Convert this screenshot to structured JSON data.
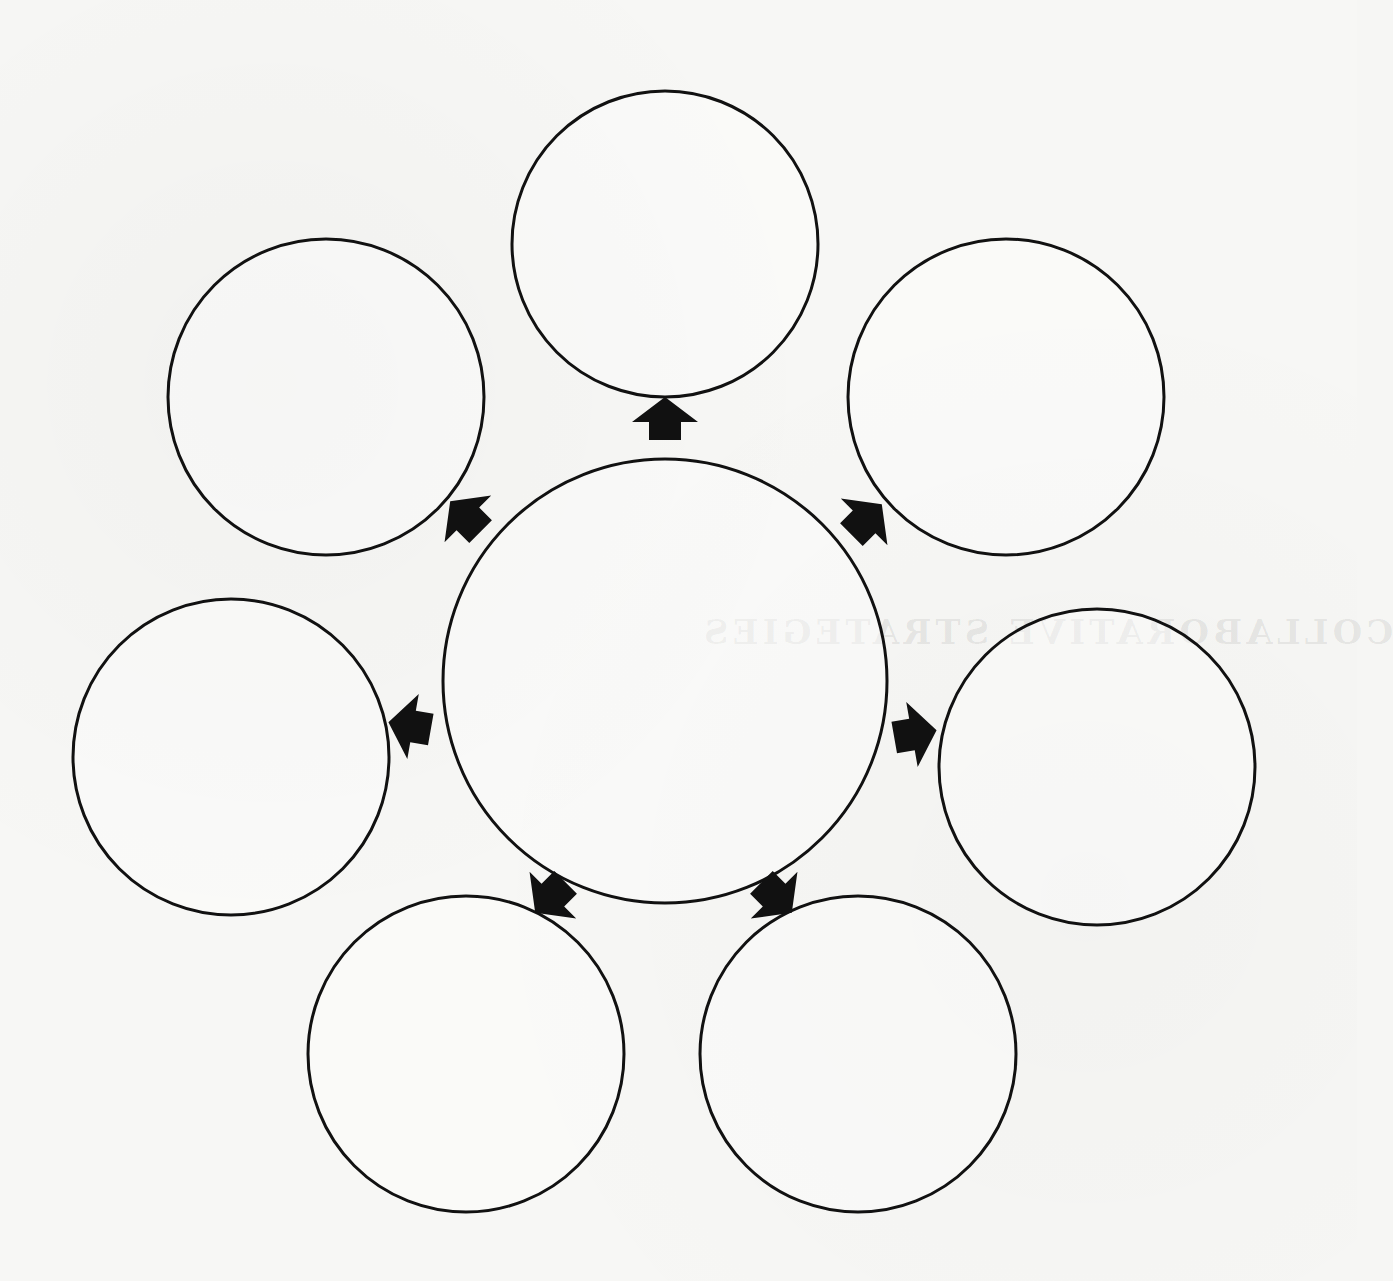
{
  "diagram": {
    "type": "concept-map",
    "stroke_color": "#111111",
    "background_color": "#f7f7f5",
    "center": {
      "id": "center",
      "cx": 665,
      "cy": 681,
      "r": 222,
      "label": ""
    },
    "nodes": [
      {
        "id": "top",
        "cx": 665,
        "cy": 244,
        "r": 153,
        "label": ""
      },
      {
        "id": "upper-left",
        "cx": 326,
        "cy": 397,
        "r": 158,
        "label": ""
      },
      {
        "id": "upper-right",
        "cx": 1006,
        "cy": 397,
        "r": 158,
        "label": ""
      },
      {
        "id": "left",
        "cx": 231,
        "cy": 757,
        "r": 158,
        "label": ""
      },
      {
        "id": "right",
        "cx": 1097,
        "cy": 767,
        "r": 158,
        "label": ""
      },
      {
        "id": "bottom-left",
        "cx": 466,
        "cy": 1054,
        "r": 158,
        "label": ""
      },
      {
        "id": "bottom-right",
        "cx": 858,
        "cy": 1054,
        "r": 158,
        "label": ""
      }
    ],
    "arrows": [
      {
        "id": "to-top",
        "x": 665,
        "y": 425,
        "angle": 0
      },
      {
        "id": "to-upper-left",
        "x": 470,
        "y": 521,
        "angle": -45
      },
      {
        "id": "to-upper-right",
        "x": 862,
        "y": 524,
        "angle": 45
      },
      {
        "id": "to-left",
        "x": 416,
        "y": 727,
        "angle": -80
      },
      {
        "id": "to-right",
        "x": 909,
        "y": 735,
        "angle": 80
      },
      {
        "id": "to-bottom-left",
        "x": 555,
        "y": 893,
        "angle": -135
      },
      {
        "id": "to-bottom-right",
        "x": 772,
        "y": 893,
        "angle": 135
      }
    ]
  },
  "bleed_through": {
    "title": "COLLABORATIVE STRATEGIES"
  }
}
